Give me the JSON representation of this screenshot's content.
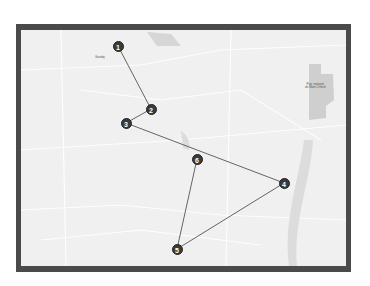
{
  "map": {
    "frame_color": "#4a4a4a",
    "background_color": "#f0f0f0",
    "route_color": "#555555",
    "place_labels": [
      {
        "text": "Granby",
        "x": 80,
        "y": 28
      },
      {
        "text": "Parc national\nde Mont-Orford",
        "x": 300,
        "y": 55
      }
    ],
    "markers": [
      {
        "label": "1",
        "x": 97,
        "y": 16
      },
      {
        "label": "2",
        "x": 130,
        "y": 79
      },
      {
        "label": "3",
        "x": 105,
        "y": 93
      },
      {
        "label": "4",
        "x": 263,
        "y": 153
      },
      {
        "label": "5",
        "x": 156,
        "y": 219
      },
      {
        "label": "6",
        "x": 176,
        "y": 129
      }
    ],
    "route_order": [
      "1",
      "2",
      "3",
      "4",
      "5",
      "6"
    ]
  }
}
